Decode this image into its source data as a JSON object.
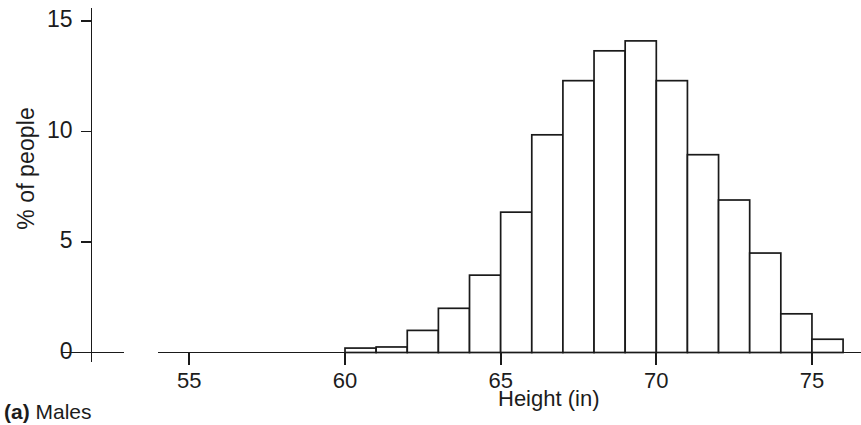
{
  "figure": {
    "caption_label": "(a)",
    "caption_text": " Males"
  },
  "chart_data": {
    "type": "bar",
    "title": "",
    "subtitle": "",
    "xlabel": "Height (in)",
    "ylabel": "% of people",
    "xlim": [
      53,
      76
    ],
    "ylim": [
      0,
      15.5
    ],
    "xticks": [
      55,
      60,
      65,
      70,
      75
    ],
    "xtick_labels": [
      "55",
      "60",
      "65",
      "70",
      "75"
    ],
    "yticks": [
      0,
      5,
      10,
      15
    ],
    "ytick_labels": [
      "0",
      "5",
      "10",
      "15"
    ],
    "grid": false,
    "legend": null,
    "bin_width": 1,
    "bin_edges": [
      60,
      61,
      62,
      63,
      64,
      65,
      66,
      67,
      68,
      69,
      70,
      71,
      72,
      73,
      74,
      75,
      76
    ],
    "categories": [
      "60-61",
      "61-62",
      "62-63",
      "63-64",
      "64-65",
      "65-66",
      "66-67",
      "67-68",
      "68-69",
      "69-70",
      "70-71",
      "71-72",
      "72-73",
      "73-74",
      "74-75",
      "75-76"
    ],
    "values": [
      0.2,
      0.25,
      1.0,
      2.0,
      3.5,
      6.35,
      9.85,
      12.3,
      13.65,
      14.1,
      12.3,
      8.95,
      6.9,
      4.5,
      1.75,
      0.6
    ],
    "bar_fill": "#ffffff",
    "bar_stroke": "#1a1a1a",
    "axis_color": "#1a1a1a"
  }
}
